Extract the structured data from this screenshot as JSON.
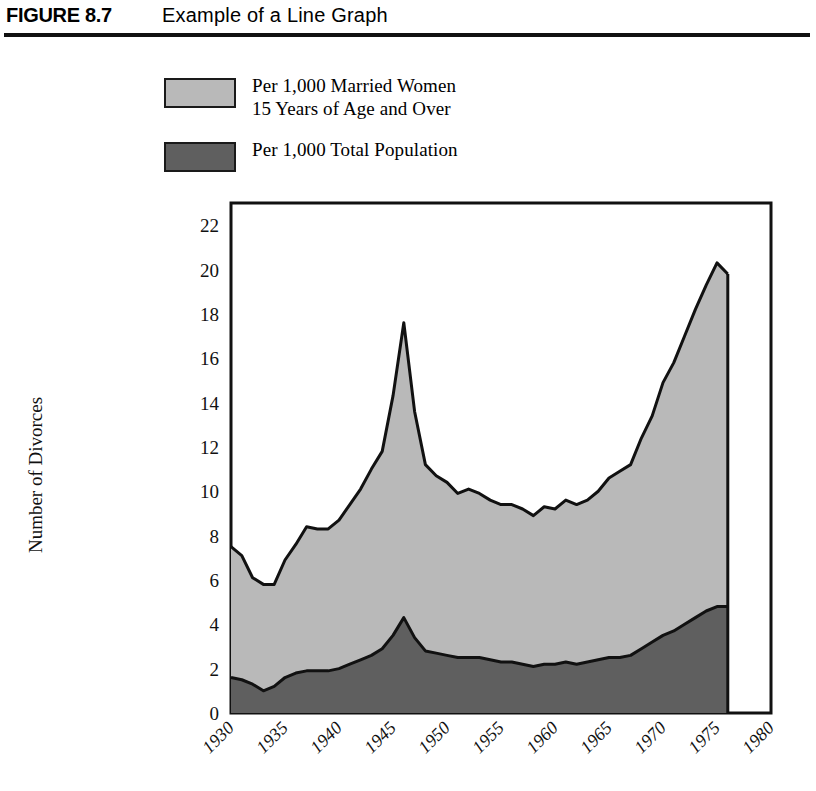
{
  "header": {
    "figure_number": "FIGURE 8.7",
    "title": "Example of a Line Graph"
  },
  "legend": {
    "items": [
      {
        "label": "Per 1,000 Married Women\n15 Years of Age and Over",
        "color": "#b9b9b9",
        "series": "married_women"
      },
      {
        "label": "Per 1,000 Total Population",
        "color": "#5f5f5f",
        "series": "total_population"
      }
    ]
  },
  "chart_data": {
    "type": "area",
    "title": "Example of a Line Graph",
    "xlabel": "",
    "ylabel": "Number of Divorces",
    "stacked": true,
    "grid": false,
    "legend_position": "above-plot",
    "xlim": [
      1930,
      1980
    ],
    "ylim": [
      0,
      23
    ],
    "y_ticks": [
      0,
      2,
      4,
      6,
      8,
      10,
      12,
      14,
      16,
      18,
      20,
      22
    ],
    "x_ticks": [
      1930,
      1935,
      1940,
      1945,
      1950,
      1955,
      1960,
      1965,
      1970,
      1975,
      1980
    ],
    "x_tick_rotation": 45,
    "x": [
      1930,
      1931,
      1932,
      1933,
      1934,
      1935,
      1936,
      1937,
      1938,
      1939,
      1940,
      1941,
      1942,
      1943,
      1944,
      1945,
      1946,
      1947,
      1948,
      1949,
      1950,
      1951,
      1952,
      1953,
      1954,
      1955,
      1956,
      1957,
      1958,
      1959,
      1960,
      1961,
      1962,
      1963,
      1964,
      1965,
      1966,
      1967,
      1968,
      1969,
      1970,
      1971,
      1972,
      1973,
      1974,
      1975,
      1976
    ],
    "series": [
      {
        "name": "Per 1,000 Total Population",
        "color": "#5f5f5f",
        "values": [
          1.6,
          1.5,
          1.3,
          1.0,
          1.2,
          1.6,
          1.8,
          1.9,
          1.9,
          1.9,
          2.0,
          2.2,
          2.4,
          2.6,
          2.9,
          3.5,
          4.3,
          3.4,
          2.8,
          2.7,
          2.6,
          2.5,
          2.5,
          2.5,
          2.4,
          2.3,
          2.3,
          2.2,
          2.1,
          2.2,
          2.2,
          2.3,
          2.2,
          2.3,
          2.4,
          2.5,
          2.5,
          2.6,
          2.9,
          3.2,
          3.5,
          3.7,
          4.0,
          4.3,
          4.6,
          4.8,
          4.8
        ],
        "note": "Divorce rate per 1,000 total population"
      },
      {
        "name": "Per 1,000 Married Women 15 Years of Age and Over",
        "color": "#b9b9b9",
        "values": [
          7.5,
          7.1,
          6.1,
          5.8,
          5.8,
          6.9,
          7.6,
          8.4,
          8.3,
          8.3,
          8.7,
          9.4,
          10.1,
          11.0,
          11.8,
          14.3,
          17.6,
          13.6,
          11.2,
          10.7,
          10.4,
          9.9,
          10.1,
          9.9,
          9.6,
          9.4,
          9.4,
          9.2,
          8.9,
          9.3,
          9.2,
          9.6,
          9.4,
          9.6,
          10.0,
          10.6,
          10.9,
          11.2,
          12.4,
          13.4,
          14.9,
          15.8,
          17.0,
          18.2,
          19.3,
          20.3,
          19.8
        ],
        "note": "Cumulative top boundary of the stacked area (divorce rate per 1,000 married women 15+)"
      }
    ],
    "annotations": {
      "peak_year": 1946,
      "peak_married_women": 17.6,
      "peak_total_population": 4.3,
      "final_year": 1976,
      "final_married_women": 19.8,
      "final_total_population": 4.8,
      "trough_year": 1933,
      "trough_married_women": 5.8
    }
  },
  "axes": {
    "y_title": "Number of Divorces",
    "y_tick_labels": [
      "22",
      "20",
      "18",
      "16",
      "14",
      "12",
      "10",
      "8",
      "6",
      "4",
      "2",
      "0"
    ],
    "x_tick_labels": [
      "1930",
      "1935",
      "1940",
      "1945",
      "1950",
      "1955",
      "1960",
      "1965",
      "1970",
      "1975",
      "1980"
    ]
  },
  "style": {
    "frame_color": "#111111",
    "light_series_color": "#b9b9b9",
    "dark_series_color": "#5f5f5f",
    "background": "#ffffff"
  }
}
